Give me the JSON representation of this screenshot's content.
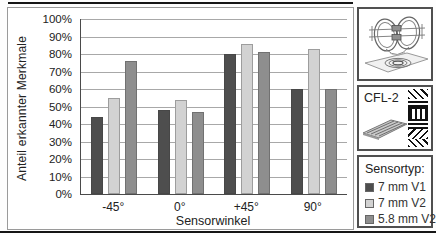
{
  "chart_data": {
    "type": "bar",
    "title": "",
    "categories": [
      "-45°",
      "0°",
      "+45°",
      "90°"
    ],
    "series": [
      {
        "name": "7 mm V1",
        "color": "#4e4e4e",
        "values": [
          44,
          48,
          80,
          60
        ]
      },
      {
        "name": "7 mm V2",
        "color": "#d2d2d2",
        "values": [
          55,
          54,
          86,
          83
        ]
      },
      {
        "name": "5.8 mm V2",
        "color": "#8e8e8e",
        "values": [
          76,
          47,
          81,
          60
        ]
      }
    ],
    "xlabel": "Sensorwinkel",
    "ylabel": "Anteil erkannter Merkmale",
    "ylim": [
      0,
      100
    ],
    "ytick_step": 10,
    "yticks": [
      "0%",
      "10%",
      "20%",
      "30%",
      "40%",
      "50%",
      "60%",
      "70%",
      "80%",
      "90%",
      "100%"
    ],
    "grid": true,
    "legend_position": "outside-right"
  },
  "side_panel": {
    "sensor_image_name": "coil-sensor-illustration",
    "specimen": {
      "label": "CFL-2",
      "plate_image_name": "meander-sensor-plate",
      "pattern_image_name": "cfrp-layup-pattern"
    },
    "legend": {
      "title": "Sensortyp:",
      "items": [
        {
          "label": "7 mm V1",
          "color": "#4e4e4e"
        },
        {
          "label": "7 mm V2",
          "color": "#d2d2d2"
        },
        {
          "label": "5.8 mm V2",
          "color": "#8e8e8e"
        }
      ]
    }
  }
}
